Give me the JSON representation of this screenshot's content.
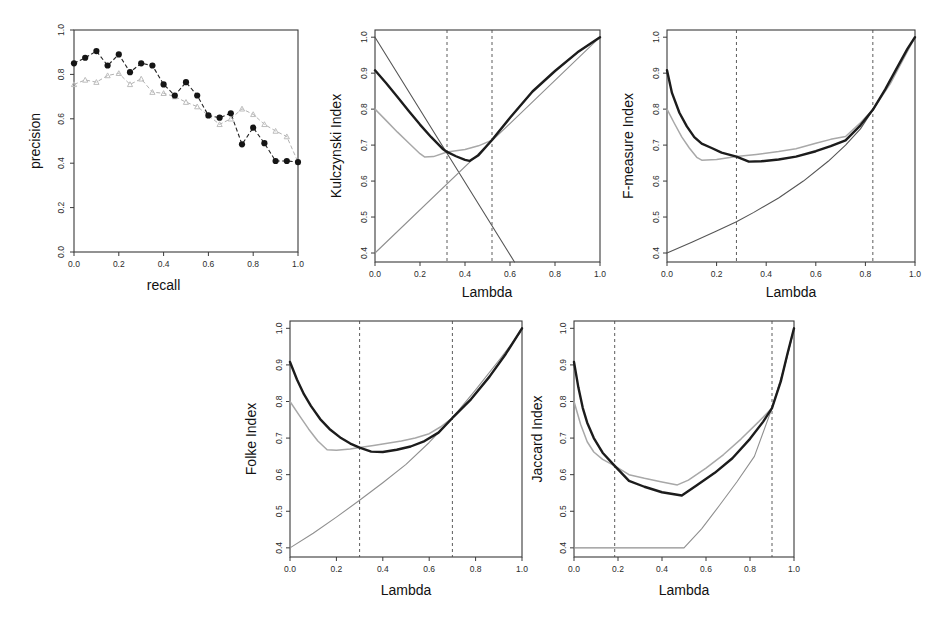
{
  "figure": {
    "width": 938,
    "height": 622,
    "background": "#ffffff",
    "series_colors": {
      "black_curve": "#1c1c1c",
      "gray_curve": "#a8a8a8",
      "thin_dark": "#555555",
      "thin_gray": "#8f8f8f",
      "dashed_vline": "#4a4a4a"
    }
  },
  "panels": {
    "precision_recall": {
      "xlabel": "recall",
      "ylabel": "precision",
      "xticks": [
        "0.0",
        "0.2",
        "0.4",
        "0.6",
        "0.8",
        "1.0"
      ],
      "yticks": [
        "0.0",
        "0.2",
        "0.4",
        "0.6",
        "0.8",
        "1.0"
      ]
    },
    "kulczynski": {
      "xlabel": "Lambda",
      "ylabel": "Kulczynski Index",
      "xticks": [
        "0.0",
        "0.2",
        "0.4",
        "0.6",
        "0.8",
        "1.0"
      ],
      "yticks": [
        "0.4",
        "0.5",
        "0.6",
        "0.7",
        "0.8",
        "0.9",
        "1.0"
      ]
    },
    "fmeasure": {
      "xlabel": "Lambda",
      "ylabel": "F-measure Index",
      "xticks": [
        "0.0",
        "0.2",
        "0.4",
        "0.6",
        "0.8",
        "1.0"
      ],
      "yticks": [
        "0.4",
        "0.5",
        "0.6",
        "0.7",
        "0.8",
        "0.9",
        "1.0"
      ]
    },
    "folke": {
      "xlabel": "Lambda",
      "ylabel": "Folke Index",
      "xticks": [
        "0.0",
        "0.2",
        "0.4",
        "0.6",
        "0.8",
        "1.0"
      ],
      "yticks": [
        "0.4",
        "0.5",
        "0.6",
        "0.7",
        "0.8",
        "0.9",
        "1.0"
      ]
    },
    "jaccard": {
      "xlabel": "Lambda",
      "ylabel": "Jaccard Index",
      "xticks": [
        "0.0",
        "0.2",
        "0.4",
        "0.6",
        "0.8",
        "1.0"
      ],
      "yticks": [
        "0.4",
        "0.5",
        "0.6",
        "0.7",
        "0.8",
        "0.9",
        "1.0"
      ]
    }
  },
  "chart_data": [
    {
      "id": "precision_recall",
      "type": "line",
      "title": "",
      "xlabel": "recall",
      "ylabel": "precision",
      "xlim": [
        0.0,
        1.0
      ],
      "ylim": [
        0.0,
        1.0
      ],
      "xticks": [
        0.0,
        0.2,
        0.4,
        0.6,
        0.8,
        1.0
      ],
      "yticks": [
        0.0,
        0.2,
        0.4,
        0.6,
        0.8,
        1.0
      ],
      "grid": false,
      "legend": "none",
      "x": [
        0.0,
        0.05,
        0.1,
        0.15,
        0.2,
        0.25,
        0.3,
        0.35,
        0.4,
        0.45,
        0.5,
        0.55,
        0.6,
        0.65,
        0.7,
        0.75,
        0.8,
        0.85,
        0.9,
        0.95,
        1.0
      ],
      "series": [
        {
          "name": "black-filled-circles",
          "marker": "circle",
          "linestyle": "dashed",
          "color": "#151515",
          "values": [
            0.85,
            0.875,
            0.905,
            0.84,
            0.89,
            0.81,
            0.85,
            0.84,
            0.755,
            0.705,
            0.765,
            0.705,
            0.615,
            0.605,
            0.625,
            0.485,
            0.56,
            0.49,
            0.41,
            0.41,
            0.405
          ]
        },
        {
          "name": "gray-triangles",
          "marker": "triangle",
          "linestyle": "dashed",
          "color": "#bdbdbd",
          "values": [
            0.755,
            0.775,
            0.765,
            0.795,
            0.805,
            0.755,
            0.78,
            0.72,
            0.715,
            0.7,
            0.675,
            0.655,
            0.615,
            0.575,
            0.6,
            0.645,
            0.62,
            0.575,
            0.545,
            0.52,
            0.405
          ]
        }
      ]
    },
    {
      "id": "kulczynski",
      "type": "line",
      "title": "",
      "xlabel": "Lambda",
      "ylabel": "Kulczynski Index",
      "xlim": [
        0.0,
        1.0
      ],
      "ylim": [
        0.375,
        1.02
      ],
      "xticks": [
        0.0,
        0.2,
        0.4,
        0.6,
        0.8,
        1.0
      ],
      "yticks": [
        0.4,
        0.5,
        0.6,
        0.7,
        0.8,
        0.9,
        1.0
      ],
      "grid": false,
      "legend": "none",
      "vlines": [
        0.32,
        0.52
      ],
      "series": [
        {
          "name": "black-thick-curve",
          "color": "#1c1c1c",
          "width": 2.4,
          "x": [
            0.0,
            0.05,
            0.1,
            0.15,
            0.2,
            0.25,
            0.3,
            0.32,
            0.36,
            0.4,
            0.42,
            0.46,
            0.52,
            0.6,
            0.7,
            0.8,
            0.9,
            1.0
          ],
          "values": [
            0.908,
            0.872,
            0.834,
            0.795,
            0.757,
            0.722,
            0.69,
            0.681,
            0.669,
            0.659,
            0.656,
            0.672,
            0.714,
            0.776,
            0.849,
            0.906,
            0.958,
            1.0
          ]
        },
        {
          "name": "gray-curve",
          "color": "#a8a8a8",
          "width": 1.5,
          "x": [
            0.0,
            0.05,
            0.1,
            0.15,
            0.2,
            0.22,
            0.26,
            0.32,
            0.4,
            0.46,
            0.52,
            0.6,
            0.7,
            0.8,
            0.9,
            1.0
          ],
          "values": [
            0.8,
            0.768,
            0.736,
            0.706,
            0.676,
            0.667,
            0.668,
            0.681,
            0.688,
            0.698,
            0.714,
            0.776,
            0.849,
            0.906,
            0.958,
            1.0
          ]
        },
        {
          "name": "descending-line",
          "color": "#555555",
          "width": 1.1,
          "x": [
            0.0,
            0.62
          ],
          "values": [
            1.0,
            0.375
          ]
        },
        {
          "name": "ascending-line",
          "color": "#8f8f8f",
          "width": 1.1,
          "x": [
            0.0,
            1.0
          ],
          "values": [
            0.4,
            1.0
          ]
        }
      ]
    },
    {
      "id": "fmeasure",
      "type": "line",
      "title": "",
      "xlabel": "F-measure Index",
      "ylabel": "F-measure Index",
      "xlim": [
        0.0,
        1.0
      ],
      "ylim": [
        0.375,
        1.02
      ],
      "xticks": [
        0.0,
        0.2,
        0.4,
        0.6,
        0.8,
        1.0
      ],
      "yticks": [
        0.4,
        0.5,
        0.6,
        0.7,
        0.8,
        0.9,
        1.0
      ],
      "grid": false,
      "legend": "none",
      "vlines": [
        0.28,
        0.83
      ],
      "series": [
        {
          "name": "black-thick-curve",
          "color": "#1c1c1c",
          "width": 2.4,
          "x": [
            0.0,
            0.02,
            0.05,
            0.08,
            0.11,
            0.14,
            0.18,
            0.22,
            0.28,
            0.33,
            0.38,
            0.45,
            0.52,
            0.6,
            0.66,
            0.72,
            0.78,
            0.83,
            0.88,
            0.93,
            0.97,
            1.0
          ],
          "values": [
            0.908,
            0.845,
            0.79,
            0.752,
            0.722,
            0.704,
            0.692,
            0.679,
            0.668,
            0.654,
            0.655,
            0.66,
            0.668,
            0.683,
            0.697,
            0.713,
            0.755,
            0.798,
            0.855,
            0.918,
            0.968,
            1.0
          ]
        },
        {
          "name": "gray-curve",
          "color": "#a8a8a8",
          "width": 1.5,
          "x": [
            0.0,
            0.03,
            0.06,
            0.09,
            0.12,
            0.14,
            0.2,
            0.28,
            0.36,
            0.45,
            0.52,
            0.6,
            0.66,
            0.72,
            0.78,
            0.83,
            0.9,
            1.0
          ],
          "values": [
            0.8,
            0.76,
            0.722,
            0.692,
            0.666,
            0.658,
            0.66,
            0.668,
            0.674,
            0.682,
            0.69,
            0.705,
            0.716,
            0.724,
            0.762,
            0.798,
            0.87,
            1.0
          ]
        },
        {
          "name": "convex-rising-line",
          "color": "#555555",
          "width": 1.1,
          "x": [
            0.0,
            0.1,
            0.2,
            0.28,
            0.35,
            0.45,
            0.55,
            0.65,
            0.72,
            0.78,
            0.83,
            0.88,
            0.93,
            0.97,
            1.0
          ],
          "values": [
            0.4,
            0.43,
            0.461,
            0.487,
            0.513,
            0.553,
            0.6,
            0.655,
            0.7,
            0.745,
            0.798,
            0.855,
            0.918,
            0.968,
            1.0
          ]
        }
      ]
    },
    {
      "id": "folke",
      "type": "line",
      "title": "",
      "xlabel": "Lambda",
      "ylabel": "Folke Index",
      "xlim": [
        0.0,
        1.0
      ],
      "ylim": [
        0.375,
        1.02
      ],
      "xticks": [
        0.0,
        0.2,
        0.4,
        0.6,
        0.8,
        1.0
      ],
      "yticks": [
        0.4,
        0.5,
        0.6,
        0.7,
        0.8,
        0.9,
        1.0
      ],
      "grid": false,
      "legend": "none",
      "vlines": [
        0.3,
        0.7
      ],
      "series": [
        {
          "name": "black-thick-curve",
          "color": "#1c1c1c",
          "width": 2.4,
          "x": [
            0.0,
            0.03,
            0.06,
            0.09,
            0.13,
            0.17,
            0.22,
            0.26,
            0.3,
            0.35,
            0.4,
            0.46,
            0.52,
            0.58,
            0.64,
            0.7,
            0.78,
            0.86,
            0.93,
            1.0
          ],
          "values": [
            0.908,
            0.86,
            0.82,
            0.788,
            0.752,
            0.725,
            0.7,
            0.685,
            0.674,
            0.663,
            0.662,
            0.668,
            0.677,
            0.692,
            0.715,
            0.755,
            0.806,
            0.868,
            0.93,
            1.0
          ]
        },
        {
          "name": "gray-curve",
          "color": "#a8a8a8",
          "width": 1.5,
          "x": [
            0.0,
            0.04,
            0.08,
            0.12,
            0.16,
            0.2,
            0.26,
            0.3,
            0.36,
            0.42,
            0.48,
            0.54,
            0.6,
            0.65,
            0.7,
            0.78,
            0.86,
            0.93,
            1.0
          ],
          "values": [
            0.8,
            0.762,
            0.725,
            0.692,
            0.668,
            0.667,
            0.67,
            0.674,
            0.68,
            0.686,
            0.692,
            0.7,
            0.712,
            0.731,
            0.755,
            0.806,
            0.868,
            0.93,
            1.0
          ]
        },
        {
          "name": "rising-line",
          "color": "#777777",
          "width": 1.1,
          "x": [
            0.0,
            0.1,
            0.2,
            0.3,
            0.4,
            0.5,
            0.6,
            0.7,
            0.8,
            0.9,
            1.0
          ],
          "values": [
            0.4,
            0.44,
            0.484,
            0.53,
            0.578,
            0.628,
            0.688,
            0.755,
            0.832,
            0.912,
            0.995
          ]
        }
      ]
    },
    {
      "id": "jaccard",
      "type": "line",
      "title": "",
      "xlabel": "Lambda",
      "ylabel": "Jaccard Index",
      "xlim": [
        0.0,
        1.0
      ],
      "ylim": [
        0.375,
        1.02
      ],
      "xticks": [
        0.0,
        0.2,
        0.4,
        0.6,
        0.8,
        1.0
      ],
      "yticks": [
        0.4,
        0.5,
        0.6,
        0.7,
        0.8,
        0.9,
        1.0
      ],
      "grid": false,
      "legend": "none",
      "vlines": [
        0.185,
        0.9
      ],
      "series": [
        {
          "name": "black-thick-curve",
          "color": "#1c1c1c",
          "width": 2.4,
          "x": [
            0.0,
            0.02,
            0.04,
            0.06,
            0.09,
            0.13,
            0.185,
            0.25,
            0.32,
            0.4,
            0.49,
            0.56,
            0.64,
            0.72,
            0.8,
            0.86,
            0.9,
            0.94,
            0.97,
            1.0
          ],
          "values": [
            0.908,
            0.838,
            0.782,
            0.742,
            0.7,
            0.66,
            0.624,
            0.583,
            0.567,
            0.552,
            0.543,
            0.572,
            0.605,
            0.645,
            0.698,
            0.745,
            0.782,
            0.855,
            0.93,
            1.0
          ]
        },
        {
          "name": "gray-curve",
          "color": "#a8a8a8",
          "width": 1.5,
          "x": [
            0.0,
            0.03,
            0.06,
            0.09,
            0.13,
            0.185,
            0.25,
            0.32,
            0.4,
            0.47,
            0.52,
            0.6,
            0.68,
            0.76,
            0.84,
            0.9,
            0.95,
            1.0
          ],
          "values": [
            0.8,
            0.738,
            0.69,
            0.662,
            0.642,
            0.624,
            0.6,
            0.59,
            0.58,
            0.572,
            0.585,
            0.618,
            0.655,
            0.698,
            0.745,
            0.782,
            0.88,
            1.0
          ]
        },
        {
          "name": "flat-then-rising-line",
          "color": "#777777",
          "width": 1.1,
          "x": [
            0.0,
            0.185,
            0.4,
            0.5,
            0.58,
            0.66,
            0.74,
            0.82,
            0.9,
            0.95,
            1.0
          ],
          "values": [
            0.4,
            0.4,
            0.4,
            0.4,
            0.452,
            0.515,
            0.58,
            0.65,
            0.782,
            0.88,
            0.995
          ]
        }
      ]
    }
  ]
}
